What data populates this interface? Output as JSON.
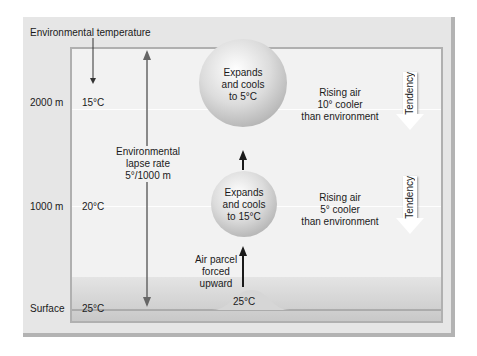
{
  "header": {
    "environmental_temperature_label": "Environmental temperature"
  },
  "altitudes": [
    {
      "label": "2000 m",
      "env_temp": "15°C"
    },
    {
      "label": "1000 m",
      "env_temp": "20°C"
    },
    {
      "label": "Surface",
      "env_temp": "25°C"
    }
  ],
  "lapse_rate": {
    "line1": "Environmental",
    "line2": "lapse rate",
    "line3": "5°/1000 m"
  },
  "parcels": [
    {
      "line1": "Expands",
      "line2": "and cools",
      "line3": "to 5°C"
    },
    {
      "line1": "Expands",
      "line2": "and cools",
      "line3": "to 15°C"
    }
  ],
  "rising_notes": [
    {
      "line1": "Rising air",
      "line2": "10° cooler",
      "line3": "than environment"
    },
    {
      "line1": "Rising air",
      "line2": "5° cooler",
      "line3": "than environment"
    }
  ],
  "tendency_label": "Tendency",
  "forced": {
    "line1": "Air parcel",
    "line2": "forced",
    "line3": "upward"
  },
  "surface_parcel_temp": "25°C",
  "colors": {
    "panel": "#e6e6e6",
    "inner": "#f2f2f2",
    "arrow": "#1a1a1a",
    "lapse_line": "#666666"
  }
}
